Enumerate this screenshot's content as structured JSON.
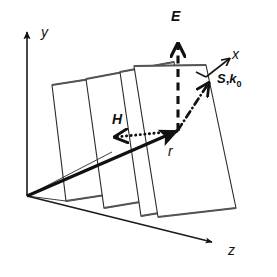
{
  "figure": {
    "background_color": "#ffffff",
    "line_color": "#111111",
    "plane_edge_color": "#2b2b2b",
    "plane_shade_color": "#555555",
    "width": 277,
    "height": 277
  },
  "axes": {
    "y": {
      "label": "y",
      "description": "vertical axis arrow pointing up",
      "origin": [
        27,
        196
      ],
      "tip": [
        27,
        30
      ]
    },
    "x": {
      "label": "x",
      "description": "axis arrow pointing up-right from front plane corner",
      "start": [
        206,
        77
      ],
      "tip": [
        231,
        57
      ]
    },
    "z": {
      "label": "z",
      "description": "axis arrow pointing down-right toward viewer",
      "origin": [
        27,
        196
      ],
      "tip": [
        216,
        243
      ]
    }
  },
  "vectors": [
    {
      "name": "E",
      "label": "E",
      "style": "dashed",
      "direction": "vertical-up",
      "tail": [
        178,
        130
      ],
      "tip": [
        178,
        41
      ],
      "label_pos": [
        172,
        8
      ]
    },
    {
      "name": "H",
      "label": "H",
      "style": "dotted",
      "direction": "horizontal-left",
      "tail": [
        178,
        130
      ],
      "tip": [
        112,
        138
      ],
      "label_pos": [
        113,
        112
      ]
    },
    {
      "name": "S,k0",
      "label_S": "S",
      "label_separator": ",",
      "label_k": "k",
      "label_subscript": "0",
      "style": "dash-dot",
      "direction": "diagonal-up-right",
      "tail": [
        178,
        130
      ],
      "tip": [
        211,
        81
      ],
      "label_pos": [
        219,
        76
      ]
    },
    {
      "name": "r",
      "label": "r",
      "style": "solid-thick",
      "direction": "from-origin",
      "tail": [
        27,
        196
      ],
      "tip": [
        180,
        130
      ],
      "label_pos": [
        168,
        148
      ]
    }
  ],
  "planes": {
    "count": 4,
    "description": "four parallel staggered wavefront planes drawn as skewed quadrilaterals",
    "geometry": [
      {
        "id": "plane-4-back",
        "points": "52,85 97,78 112,194 66,201"
      },
      {
        "id": "plane-3",
        "points": "86,79 134,70 152,200 104,208"
      },
      {
        "id": "plane-2",
        "points": "120,72 174,62 195,207 141,216"
      },
      {
        "id": "plane-1-front",
        "points": "132,66 206,66 236,208 158,217"
      }
    ]
  },
  "labels": {
    "y_axis": "y",
    "x_axis": "x",
    "z_axis": "z",
    "E_field": "E",
    "H_field": "H",
    "poynting": "S",
    "wavevector": "k",
    "wavevector_sub": "0",
    "position_vector": "r"
  }
}
